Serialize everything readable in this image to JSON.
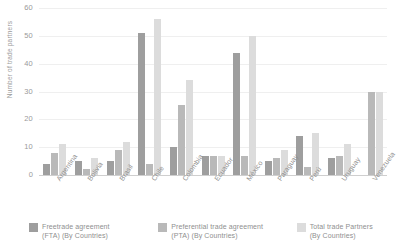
{
  "chart_data": {
    "type": "bar",
    "title": "",
    "xlabel": "",
    "ylabel": "Number of trade partners",
    "ylim": [
      0,
      60
    ],
    "yticks": [
      0,
      10,
      20,
      30,
      40,
      50,
      60
    ],
    "grid": true,
    "legend_position": "bottom",
    "categories": [
      "Argentina",
      "Bolivia",
      "Brasil",
      "Chile",
      "Colombia",
      "Ecuador",
      "México",
      "Paraguay",
      "Perú",
      "Uruguay",
      "Venezuela"
    ],
    "series": [
      {
        "name": "Freetrade agreement (FTA) (By Countries)",
        "short_name": "FTA",
        "color": "#9e9e9e",
        "values": [
          4,
          5,
          5,
          51,
          10,
          7,
          44,
          5,
          14,
          6,
          0
        ]
      },
      {
        "name": "Preferential trade agreement (PTA) (By Countries)",
        "short_name": "PTA",
        "color": "#b9b9b9",
        "values": [
          8,
          2,
          9,
          4,
          25,
          7,
          7,
          6,
          3,
          7,
          30
        ]
      },
      {
        "name": "Total trade Partners (By Countries)",
        "short_name": "Total",
        "color": "#dcdcdc",
        "values": [
          11,
          6,
          12,
          56,
          34,
          7,
          50,
          9,
          15,
          11,
          30
        ]
      }
    ]
  },
  "legend": {
    "items": [
      {
        "line1": "Freetrade agreement",
        "line2": "(FTA) (By Countries)",
        "swatch_class": "fta"
      },
      {
        "line1": "Preferential trade agreement",
        "line2": "(PTA) (By Countries)",
        "swatch_class": "pta"
      },
      {
        "line1": "Total trade Partners",
        "line2": "(By Countries)",
        "swatch_class": "total"
      }
    ]
  }
}
